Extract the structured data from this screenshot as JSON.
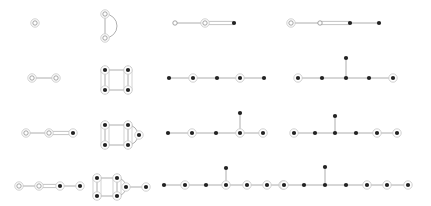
{
  "colors": {
    "edge": "#9a9a9a",
    "node_filled": "#222222",
    "node_open": "#ffffff",
    "halo": "#c4c4c4"
  },
  "graphs": [
    {
      "id": "g1",
      "nodes": [
        {
          "x": 35,
          "y": 23,
          "type": "open",
          "halo": true
        }
      ],
      "edges": [],
      "hulls": []
    },
    {
      "id": "g2",
      "nodes": [
        {
          "x": 105,
          "y": 14,
          "type": "open",
          "halo": true
        },
        {
          "x": 105,
          "y": 38,
          "type": "open",
          "halo": true
        }
      ],
      "edges": [
        [
          0,
          1
        ]
      ],
      "arcs": [
        [
          0,
          1
        ]
      ],
      "hulls": []
    },
    {
      "id": "g3",
      "nodes": [
        {
          "x": 175,
          "y": 23,
          "type": "open",
          "halo": false
        },
        {
          "x": 205,
          "y": 23,
          "type": "open",
          "halo": true
        },
        {
          "x": 234,
          "y": 23,
          "type": "filled",
          "halo": false
        }
      ],
      "edges": [
        [
          0,
          1
        ],
        [
          1,
          2
        ]
      ],
      "double": [
        [
          1,
          2
        ]
      ],
      "hulls": []
    },
    {
      "id": "g4",
      "nodes": [
        {
          "x": 291,
          "y": 23,
          "type": "open",
          "halo": true
        },
        {
          "x": 320,
          "y": 23,
          "type": "open",
          "halo": false
        },
        {
          "x": 350,
          "y": 23,
          "type": "filled",
          "halo": false
        },
        {
          "x": 379,
          "y": 23,
          "type": "filled",
          "halo": false
        }
      ],
      "edges": [
        [
          0,
          1
        ],
        [
          1,
          2
        ],
        [
          2,
          3
        ]
      ],
      "double": [
        [
          1,
          2
        ]
      ],
      "hulls": []
    },
    {
      "id": "g5",
      "nodes": [
        {
          "x": 32,
          "y": 78,
          "type": "open",
          "halo": true
        },
        {
          "x": 56,
          "y": 78,
          "type": "open",
          "halo": true
        }
      ],
      "edges": [
        [
          0,
          1
        ]
      ],
      "hulls": []
    },
    {
      "id": "g6",
      "nodes": [
        {
          "x": 105,
          "y": 70,
          "type": "filled",
          "halo": true
        },
        {
          "x": 128,
          "y": 70,
          "type": "filled",
          "halo": true
        },
        {
          "x": 105,
          "y": 90,
          "type": "filled",
          "halo": true
        },
        {
          "x": 128,
          "y": 90,
          "type": "filled",
          "halo": true
        }
      ],
      "edges": [
        [
          0,
          1
        ],
        [
          2,
          3
        ],
        [
          0,
          2
        ],
        [
          1,
          3
        ]
      ],
      "hulls": [
        [
          0,
          2
        ],
        [
          1,
          3
        ]
      ]
    },
    {
      "id": "g7",
      "nodes": [
        {
          "x": 169,
          "y": 78,
          "type": "filled",
          "halo": false
        },
        {
          "x": 193,
          "y": 78,
          "type": "filled",
          "halo": true
        },
        {
          "x": 217,
          "y": 78,
          "type": "filled",
          "halo": false
        },
        {
          "x": 240,
          "y": 78,
          "type": "filled",
          "halo": true
        },
        {
          "x": 264,
          "y": 78,
          "type": "filled",
          "halo": false
        }
      ],
      "edges": [
        [
          0,
          1
        ],
        [
          1,
          2
        ],
        [
          2,
          3
        ],
        [
          3,
          4
        ]
      ],
      "hulls": []
    },
    {
      "id": "g8",
      "nodes": [
        {
          "x": 298,
          "y": 78,
          "type": "filled",
          "halo": true
        },
        {
          "x": 322,
          "y": 78,
          "type": "filled",
          "halo": false
        },
        {
          "x": 346,
          "y": 78,
          "type": "filled",
          "halo": false
        },
        {
          "x": 346,
          "y": 58,
          "type": "filled",
          "halo": false
        },
        {
          "x": 369,
          "y": 78,
          "type": "filled",
          "halo": false
        },
        {
          "x": 393,
          "y": 78,
          "type": "filled",
          "halo": true
        }
      ],
      "edges": [
        [
          0,
          1
        ],
        [
          1,
          2
        ],
        [
          2,
          3
        ],
        [
          2,
          4
        ],
        [
          4,
          5
        ]
      ],
      "hulls": []
    },
    {
      "id": "g9",
      "nodes": [
        {
          "x": 26,
          "y": 133,
          "type": "open",
          "halo": true
        },
        {
          "x": 49,
          "y": 133,
          "type": "open",
          "halo": true
        },
        {
          "x": 73,
          "y": 133,
          "type": "filled",
          "halo": true
        }
      ],
      "edges": [
        [
          0,
          1
        ],
        [
          1,
          2
        ]
      ],
      "double": [
        [
          1,
          2
        ]
      ],
      "hulls": []
    },
    {
      "id": "g10",
      "nodes": [
        {
          "x": 105,
          "y": 125,
          "type": "filled",
          "halo": true
        },
        {
          "x": 128,
          "y": 125,
          "type": "filled",
          "halo": true
        },
        {
          "x": 105,
          "y": 145,
          "type": "filled",
          "halo": true
        },
        {
          "x": 128,
          "y": 145,
          "type": "filled",
          "halo": true
        },
        {
          "x": 139,
          "y": 135,
          "type": "filled",
          "halo": true
        }
      ],
      "edges": [
        [
          0,
          1
        ],
        [
          2,
          3
        ],
        [
          0,
          2
        ],
        [
          1,
          3
        ]
      ],
      "arcs": [
        [
          1,
          3
        ]
      ],
      "hulls": [
        [
          0,
          2
        ],
        [
          1,
          3
        ]
      ]
    },
    {
      "id": "g11",
      "nodes": [
        {
          "x": 168,
          "y": 133,
          "type": "filled",
          "halo": false
        },
        {
          "x": 192,
          "y": 133,
          "type": "filled",
          "halo": true
        },
        {
          "x": 216,
          "y": 133,
          "type": "filled",
          "halo": false
        },
        {
          "x": 240,
          "y": 133,
          "type": "filled",
          "halo": true
        },
        {
          "x": 240,
          "y": 113,
          "type": "filled",
          "halo": false
        },
        {
          "x": 263,
          "y": 133,
          "type": "filled",
          "halo": true
        }
      ],
      "edges": [
        [
          0,
          1
        ],
        [
          1,
          2
        ],
        [
          2,
          3
        ],
        [
          3,
          4
        ],
        [
          3,
          5
        ]
      ],
      "hulls": []
    },
    {
      "id": "g12",
      "nodes": [
        {
          "x": 294,
          "y": 133,
          "type": "filled",
          "halo": true
        },
        {
          "x": 315,
          "y": 133,
          "type": "filled",
          "halo": false
        },
        {
          "x": 335,
          "y": 133,
          "type": "filled",
          "halo": false
        },
        {
          "x": 335,
          "y": 116,
          "type": "filled",
          "halo": false
        },
        {
          "x": 356,
          "y": 133,
          "type": "filled",
          "halo": false
        },
        {
          "x": 377,
          "y": 133,
          "type": "filled",
          "halo": true
        },
        {
          "x": 397,
          "y": 133,
          "type": "filled",
          "halo": true
        }
      ],
      "edges": [
        [
          0,
          1
        ],
        [
          1,
          2
        ],
        [
          2,
          3
        ],
        [
          2,
          4
        ],
        [
          4,
          5
        ],
        [
          5,
          6
        ]
      ],
      "hulls": []
    },
    {
      "id": "g13",
      "nodes": [
        {
          "x": 19,
          "y": 186,
          "type": "open",
          "halo": true
        },
        {
          "x": 39,
          "y": 186,
          "type": "open",
          "halo": true
        },
        {
          "x": 60,
          "y": 186,
          "type": "filled",
          "halo": true
        },
        {
          "x": 80,
          "y": 186,
          "type": "filled",
          "halo": true
        }
      ],
      "edges": [
        [
          0,
          1
        ],
        [
          1,
          2
        ],
        [
          2,
          3
        ]
      ],
      "double": [
        [
          1,
          2
        ]
      ],
      "hulls": []
    },
    {
      "id": "g14",
      "nodes": [
        {
          "x": 97,
          "y": 178,
          "type": "filled",
          "halo": true
        },
        {
          "x": 117,
          "y": 178,
          "type": "filled",
          "halo": true
        },
        {
          "x": 97,
          "y": 196,
          "type": "filled",
          "halo": true
        },
        {
          "x": 117,
          "y": 196,
          "type": "filled",
          "halo": true
        },
        {
          "x": 126,
          "y": 187,
          "type": "filled",
          "halo": true
        },
        {
          "x": 146,
          "y": 187,
          "type": "filled",
          "halo": true
        }
      ],
      "edges": [
        [
          0,
          1
        ],
        [
          2,
          3
        ],
        [
          0,
          2
        ],
        [
          1,
          3
        ],
        [
          4,
          5
        ]
      ],
      "arcs": [
        [
          1,
          3
        ]
      ],
      "hulls": [
        [
          0,
          2
        ],
        [
          1,
          3
        ]
      ]
    },
    {
      "id": "g15",
      "nodes": [
        {
          "x": 164,
          "y": 185,
          "type": "filled",
          "halo": false
        },
        {
          "x": 185,
          "y": 185,
          "type": "filled",
          "halo": true
        },
        {
          "x": 206,
          "y": 185,
          "type": "filled",
          "halo": false
        },
        {
          "x": 226,
          "y": 185,
          "type": "filled",
          "halo": true
        },
        {
          "x": 226,
          "y": 168,
          "type": "filled",
          "halo": false
        },
        {
          "x": 247,
          "y": 185,
          "type": "filled",
          "halo": true
        },
        {
          "x": 267,
          "y": 185,
          "type": "filled",
          "halo": true
        },
        {
          "x": 283,
          "y": 185,
          "type": "filled",
          "halo": true
        }
      ],
      "edges": [
        [
          0,
          1
        ],
        [
          1,
          2
        ],
        [
          2,
          3
        ],
        [
          3,
          4
        ],
        [
          3,
          5
        ],
        [
          5,
          6
        ],
        [
          6,
          7
        ]
      ],
      "hulls": []
    },
    {
      "id": "g16",
      "nodes": [
        {
          "x": 284,
          "y": 185,
          "type": "filled",
          "halo": true
        },
        {
          "x": 304,
          "y": 185,
          "type": "filled",
          "halo": false
        },
        {
          "x": 325,
          "y": 185,
          "type": "filled",
          "halo": false
        },
        {
          "x": 325,
          "y": 167,
          "type": "filled",
          "halo": false
        },
        {
          "x": 346,
          "y": 185,
          "type": "filled",
          "halo": false
        },
        {
          "x": 367,
          "y": 185,
          "type": "filled",
          "halo": true
        },
        {
          "x": 387,
          "y": 185,
          "type": "filled",
          "halo": true
        },
        {
          "x": 408,
          "y": 185,
          "type": "filled",
          "halo": true
        }
      ],
      "edges": [
        [
          0,
          1
        ],
        [
          1,
          2
        ],
        [
          2,
          3
        ],
        [
          2,
          4
        ],
        [
          4,
          5
        ],
        [
          5,
          6
        ],
        [
          6,
          7
        ]
      ],
      "hulls": []
    }
  ]
}
